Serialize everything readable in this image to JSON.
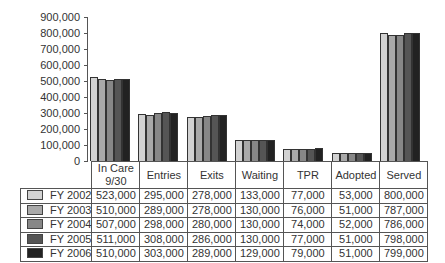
{
  "chart_data": {
    "type": "bar",
    "title": "",
    "xlabel": "",
    "ylabel": "",
    "ylim": [
      0,
      900000
    ],
    "yticks": [
      0,
      100000,
      200000,
      300000,
      400000,
      500000,
      600000,
      700000,
      800000,
      900000
    ],
    "ytick_labels": [
      "0",
      "100,000",
      "200,000",
      "300,000",
      "400,000",
      "500,000",
      "600,000",
      "700,000",
      "800,000",
      "900,000"
    ],
    "grid": false,
    "legend_position": "data-table",
    "categories": [
      "In Care 9/30",
      "Entries",
      "Exits",
      "Waiting",
      "TPR",
      "Adopted",
      "Served"
    ],
    "series": [
      {
        "name": "FY 2002",
        "color": "#d2d2d2",
        "values": [
          523000,
          295000,
          278000,
          133000,
          77000,
          53000,
          800000
        ],
        "labels": [
          "523,000",
          "295,000",
          "278,000",
          "133,000",
          "77,000",
          "53,000",
          "800,000"
        ]
      },
      {
        "name": "FY 2003",
        "color": "#a9a9a9",
        "values": [
          510000,
          289000,
          278000,
          130000,
          76000,
          51000,
          787000
        ],
        "labels": [
          "510,000",
          "289,000",
          "278,000",
          "130,000",
          "76,000",
          "51,000",
          "787,000"
        ]
      },
      {
        "name": "FY 2004",
        "color": "#878787",
        "values": [
          507000,
          298000,
          280000,
          130000,
          74000,
          52000,
          786000
        ],
        "labels": [
          "507,000",
          "298,000",
          "280,000",
          "130,000",
          "74,000",
          "52,000",
          "786,000"
        ]
      },
      {
        "name": "FY 2005",
        "color": "#555555",
        "values": [
          511000,
          308000,
          286000,
          130000,
          77000,
          51000,
          798000
        ],
        "labels": [
          "511,000",
          "308,000",
          "286,000",
          "130,000",
          "77,000",
          "51,000",
          "798,000"
        ]
      },
      {
        "name": "FY 2006",
        "color": "#222222",
        "values": [
          510000,
          303000,
          289000,
          129000,
          79000,
          51000,
          799000
        ],
        "labels": [
          "510,000",
          "303,000",
          "289,000",
          "129,000",
          "79,000",
          "51,000",
          "799,000"
        ]
      }
    ]
  }
}
